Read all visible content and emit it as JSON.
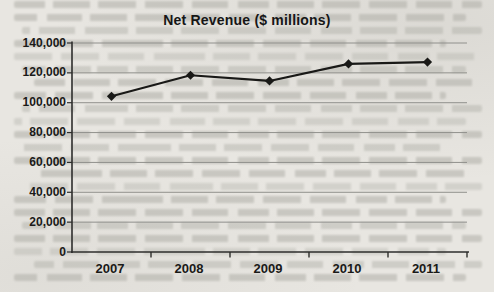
{
  "colors": {
    "page_background": "#e8e6e1",
    "bleedthrough_text": "#b0afa8",
    "chart_line": "#191917",
    "marker": "#191917",
    "gridline": "#90908c",
    "axis": "#2e2e2c",
    "label_text": "#1a1a18"
  },
  "chart_data": {
    "type": "line",
    "title": "Net Revenue ($ millions)",
    "categories": [
      "2007",
      "2008",
      "2009",
      "2010",
      "2011"
    ],
    "series": [
      {
        "name": "Net Revenue",
        "values": [
          104300,
          118400,
          114600,
          126000,
          127200
        ]
      }
    ],
    "xlabel": "",
    "ylabel": "",
    "ylim": [
      0,
      140000
    ],
    "ytick_interval": 20000,
    "ytick_labels": [
      "0",
      "20,000",
      "40,000",
      "60,000",
      "80,000",
      "100,000",
      "120,000",
      "140,000"
    ],
    "grid": "horizontal",
    "legend_position": "none",
    "marker_shape": "diamond"
  }
}
